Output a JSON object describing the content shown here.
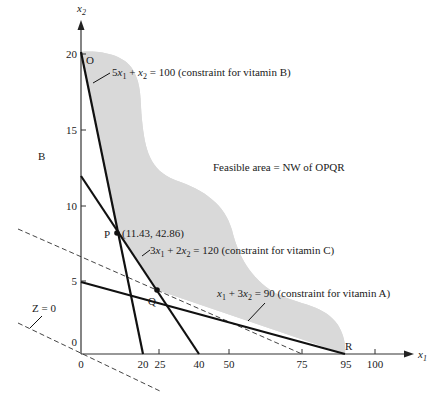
{
  "diagram": {
    "type": "linear-programming-feasible-region",
    "axes": {
      "x_label": "x",
      "x_sub": "1",
      "y_label": "x",
      "y_sub": "2",
      "x_ticks": [
        "0",
        "20",
        "25",
        "40",
        "50",
        "75",
        "95",
        "100"
      ],
      "y_ticks": [
        "0",
        "5",
        "10",
        "15",
        "20"
      ]
    },
    "region_label": "Feasible area = NW of OPQR",
    "side_label": "B",
    "points": {
      "O": "O",
      "P": "P",
      "Q": "Q",
      "R": "R",
      "P_coords": "(11.43, 42.86)"
    },
    "constraints": [
      {
        "id": "vitB",
        "lhs_a": "5",
        "var1": "x",
        "sub1": "1",
        "plus": " + ",
        "var2": "x",
        "sub2": "2",
        "rhs": " = 100 (constraint for vitamin B)"
      },
      {
        "id": "vitC",
        "lhs_a": "3",
        "var1": "x",
        "sub1": "1",
        "plus": " + 2",
        "var2": "x",
        "sub2": "2",
        "rhs": " = 120 (constraint for vitamin C)"
      },
      {
        "id": "vitA",
        "lhs_a": "",
        "var1": "x",
        "sub1": "1",
        "plus": " + 3",
        "var2": "x",
        "sub2": "2",
        "rhs": " = 90 (constraint for vitamin A)"
      }
    ],
    "iso_line_label": "Z = 0",
    "colors": {
      "shade": "#d9d9d9",
      "line": "#111111",
      "axis": "#333333",
      "dash": "#444444"
    }
  }
}
